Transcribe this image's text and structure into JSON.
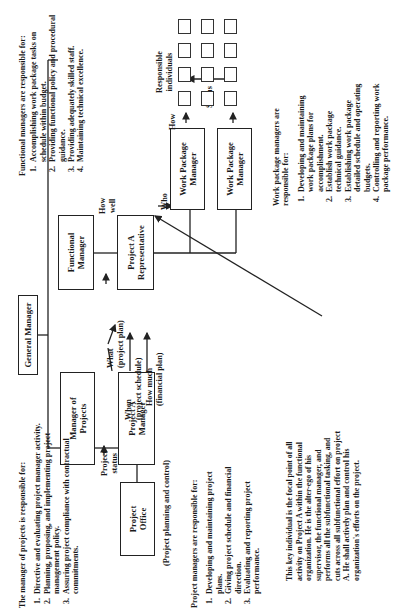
{
  "orientation": "rotated -90 degrees (page text reads bottom-to-top)",
  "boxes": {
    "general_manager": "General Manager",
    "manager_of_projects": "Manager of\nProjects",
    "project_a_manager": "Project A\nManager",
    "project_office": "Project\nOffice",
    "functional_manager": "Functional\nManager",
    "project_a_representative": "Project A\nRepresentative",
    "work_package_manager_1": "Work Package\nManager",
    "work_package_manager_2": "Work Package\nManager"
  },
  "arrow_labels": {
    "project_status": "Project\nstatus",
    "what": "What\n(project plan)",
    "when": "When\n(project schedule)",
    "how_much": "How much\n(financial plan)",
    "how_well": "How\nwell",
    "who": "Who",
    "status": "Status",
    "how": "How",
    "responsible_individuals": "Responsible\nindividuals",
    "project_office_caption": "(Project planning and control)"
  },
  "responsible_individuals_grid": {
    "rows": 3,
    "columns": 4
  },
  "notes": {
    "manager_of_projects": {
      "heading": "The manager of projects is responsible for:",
      "items": [
        "Directive and evaluating project manager activity.",
        "Planning, proposing, and implementing project management policy.",
        "Assuring project compliance with contractual commitments."
      ]
    },
    "project_managers": {
      "heading": "Project managers are responsible for:",
      "items": [
        "Developing and maintaining project plans.",
        "Giving project schedule and financial direction.",
        "Evaluating and reporting project performance."
      ]
    },
    "key_individual": "This key individual is the focal point of all activity on Project A within the functional organization.  He is the alter-ego of his supervisor, the functional manager, and performs all the subfunctional tasking, and cuts across all subfunctional effort on project A.  He shall actively plan and control his organization's efforts on the project.",
    "functional_managers": {
      "heading": "Functional managers are responsible for:",
      "items": [
        "Accomplishing work package tasks on schedule within budget.",
        "Providing functional policy and procedural guidance.",
        "Providing adequately skilled staff.",
        "Maintaining technical excellence."
      ]
    },
    "work_package_managers": {
      "heading": "Work package managers are responsible for:",
      "items": [
        "Developing and maintaining work package plans for accomplishment.",
        "Establish work package technical guidance.",
        "Establishing work package detailed schedule and operating budgets.",
        "Controlling and reporting work package performance."
      ]
    }
  },
  "colors": {
    "ink": "#222222",
    "background": "#ffffff"
  }
}
